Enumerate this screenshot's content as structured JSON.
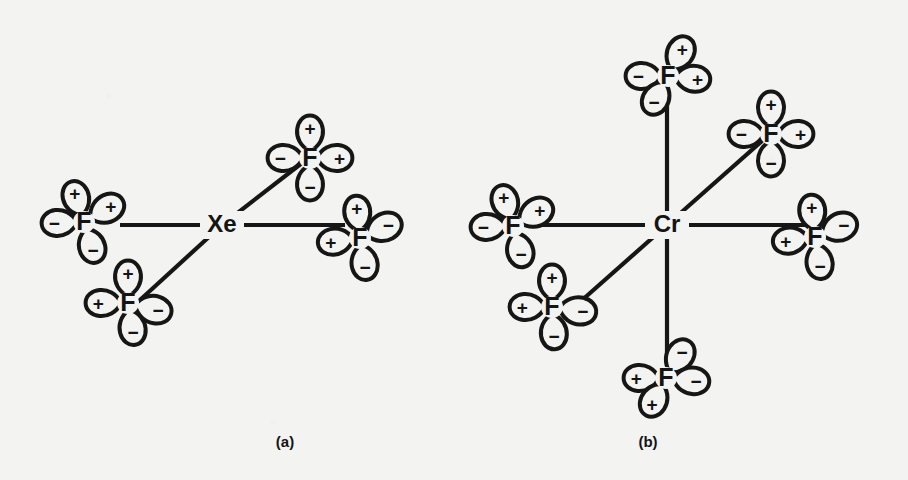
{
  "figure": {
    "background_color": "#f3f3f1",
    "ink_color": "#161616",
    "panels": [
      {
        "id": "a",
        "caption": "(a)",
        "caption_x": 285,
        "caption_y": 443,
        "center": {
          "label": "Xe",
          "x": 222,
          "y": 225
        },
        "bond_count": 4,
        "bonds": [
          {
            "name": "bond-xe-f-left",
            "x1": 222,
            "y1": 225,
            "x2": 120,
            "y2": 225
          },
          {
            "name": "bond-xe-f-right",
            "x1": 222,
            "y1": 225,
            "x2": 345,
            "y2": 225
          },
          {
            "name": "bond-xe-f-upper-right",
            "x1": 222,
            "y1": 225,
            "x2": 302,
            "y2": 163
          },
          {
            "name": "bond-xe-f-lower-left",
            "x1": 222,
            "y1": 225,
            "x2": 140,
            "y2": 300
          }
        ],
        "atoms": [
          {
            "name": "f-left",
            "label": "F",
            "x": 84,
            "y": 222,
            "lobes": [
              {
                "sign": "+",
                "angle": -108,
                "len": 40
              },
              {
                "sign": "+",
                "angle": -30,
                "len": 42
              },
              {
                "sign": "−",
                "angle": 178,
                "len": 40
              },
              {
                "sign": "−",
                "angle": 72,
                "len": 40
              }
            ]
          },
          {
            "name": "f-lower-left",
            "label": "F",
            "x": 128,
            "y": 303,
            "lobes": [
              {
                "sign": "+",
                "angle": -90,
                "len": 40
              },
              {
                "sign": "+",
                "angle": 180,
                "len": 40
              },
              {
                "sign": "−",
                "angle": 14,
                "len": 42
              },
              {
                "sign": "−",
                "angle": 80,
                "len": 40
              }
            ]
          },
          {
            "name": "f-upper-right",
            "label": "F",
            "x": 310,
            "y": 158,
            "lobes": [
              {
                "sign": "+",
                "angle": -90,
                "len": 40
              },
              {
                "sign": "−",
                "angle": 180,
                "len": 40
              },
              {
                "sign": "+",
                "angle": 0,
                "len": 40
              },
              {
                "sign": "−",
                "angle": 90,
                "len": 40
              }
            ]
          },
          {
            "name": "f-right",
            "label": "F",
            "x": 360,
            "y": 238,
            "lobes": [
              {
                "sign": "+",
                "angle": -96,
                "len": 40
              },
              {
                "sign": "−",
                "angle": -24,
                "len": 42
              },
              {
                "sign": "+",
                "angle": 172,
                "len": 40
              },
              {
                "sign": "−",
                "angle": 80,
                "len": 40
              }
            ]
          }
        ]
      },
      {
        "id": "b",
        "caption": "(b)",
        "caption_x": 648,
        "caption_y": 443,
        "center": {
          "label": "Cr",
          "x": 667,
          "y": 225
        },
        "bond_count": 6,
        "bonds": [
          {
            "name": "bond-cr-f-up",
            "x1": 667,
            "y1": 225,
            "x2": 667,
            "y2": 88
          },
          {
            "name": "bond-cr-f-down",
            "x1": 667,
            "y1": 225,
            "x2": 667,
            "y2": 366
          },
          {
            "name": "bond-cr-f-left",
            "x1": 667,
            "y1": 225,
            "x2": 533,
            "y2": 225
          },
          {
            "name": "bond-cr-f-right",
            "x1": 667,
            "y1": 225,
            "x2": 805,
            "y2": 225
          },
          {
            "name": "bond-cr-f-upper-right",
            "x1": 667,
            "y1": 225,
            "x2": 763,
            "y2": 140
          },
          {
            "name": "bond-cr-f-lower-left",
            "x1": 667,
            "y1": 225,
            "x2": 572,
            "y2": 309
          }
        ],
        "atoms": [
          {
            "name": "f-top",
            "label": "F",
            "x": 668,
            "y": 76,
            "lobes": [
              {
                "sign": "+",
                "angle": -62,
                "len": 41
              },
              {
                "sign": "−",
                "angle": 180,
                "len": 40
              },
              {
                "sign": "+",
                "angle": 6,
                "len": 40
              },
              {
                "sign": "−",
                "angle": 118,
                "len": 40
              }
            ]
          },
          {
            "name": "f-upper-right",
            "label": "F",
            "x": 771,
            "y": 134,
            "lobes": [
              {
                "sign": "+",
                "angle": -90,
                "len": 40
              },
              {
                "sign": "−",
                "angle": 180,
                "len": 40
              },
              {
                "sign": "+",
                "angle": 0,
                "len": 40
              },
              {
                "sign": "−",
                "angle": 90,
                "len": 40
              }
            ]
          },
          {
            "name": "f-left",
            "label": "F",
            "x": 513,
            "y": 226,
            "lobes": [
              {
                "sign": "+",
                "angle": -108,
                "len": 40
              },
              {
                "sign": "+",
                "angle": -30,
                "len": 42
              },
              {
                "sign": "−",
                "angle": 178,
                "len": 40
              },
              {
                "sign": "−",
                "angle": 74,
                "len": 40
              }
            ]
          },
          {
            "name": "f-right",
            "label": "F",
            "x": 815,
            "y": 237,
            "lobes": [
              {
                "sign": "+",
                "angle": -96,
                "len": 40
              },
              {
                "sign": "−",
                "angle": -22,
                "len": 42
              },
              {
                "sign": "+",
                "angle": 172,
                "len": 40
              },
              {
                "sign": "−",
                "angle": 80,
                "len": 40
              }
            ]
          },
          {
            "name": "f-lower-left",
            "label": "F",
            "x": 552,
            "y": 307,
            "lobes": [
              {
                "sign": "+",
                "angle": -90,
                "len": 40
              },
              {
                "sign": "+",
                "angle": 180,
                "len": 40
              },
              {
                "sign": "−",
                "angle": 8,
                "len": 42
              },
              {
                "sign": "−",
                "angle": 86,
                "len": 40
              }
            ]
          },
          {
            "name": "f-bottom",
            "label": "F",
            "x": 666,
            "y": 378,
            "lobes": [
              {
                "sign": "−",
                "angle": -58,
                "len": 41
              },
              {
                "sign": "+",
                "angle": 180,
                "len": 40
              },
              {
                "sign": "−",
                "angle": 6,
                "len": 41
              },
              {
                "sign": "+",
                "angle": 118,
                "len": 40
              }
            ]
          }
        ]
      }
    ]
  }
}
